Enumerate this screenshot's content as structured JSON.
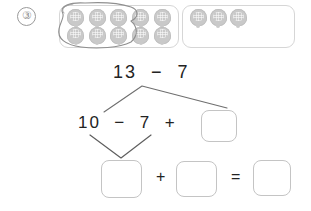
{
  "worksheet": {
    "problem_number": "③",
    "counter_color": "#c9c9c9",
    "frame_border_color": "#d6d6d6",
    "loop_color": "#8a8a8a",
    "text_color": "#232323"
  },
  "frames": [
    {
      "name": "left-ten-frame",
      "total_counters": 10,
      "rows": 2,
      "columns": 5,
      "circled_count": 7,
      "counters": [
        {
          "circled": true
        },
        {
          "circled": true
        },
        {
          "circled": true
        },
        {
          "circled": true
        },
        {
          "circled": false
        },
        {
          "circled": true
        },
        {
          "circled": true
        },
        {
          "circled": true
        },
        {
          "circled": false
        },
        {
          "circled": false
        }
      ]
    },
    {
      "name": "right-ten-frame",
      "total_counters": 3,
      "rows": 2,
      "columns": 5,
      "circled_count": 0,
      "counters": [
        {
          "circled": false
        },
        {
          "circled": false
        },
        {
          "circled": false
        },
        null,
        null,
        null,
        null,
        null,
        null,
        null
      ]
    }
  ],
  "equations": {
    "top": "13  −  7",
    "middle": "10  −  7  +",
    "bottom_plus": "+",
    "bottom_equals": "="
  },
  "answer_boxes": [
    {
      "id": "box-mid-right",
      "value": "",
      "placeholder": ""
    },
    {
      "id": "box-bottom-left",
      "value": "",
      "placeholder": ""
    },
    {
      "id": "box-bottom-mid",
      "value": "",
      "placeholder": ""
    },
    {
      "id": "box-bottom-right",
      "value": "",
      "placeholder": ""
    }
  ]
}
